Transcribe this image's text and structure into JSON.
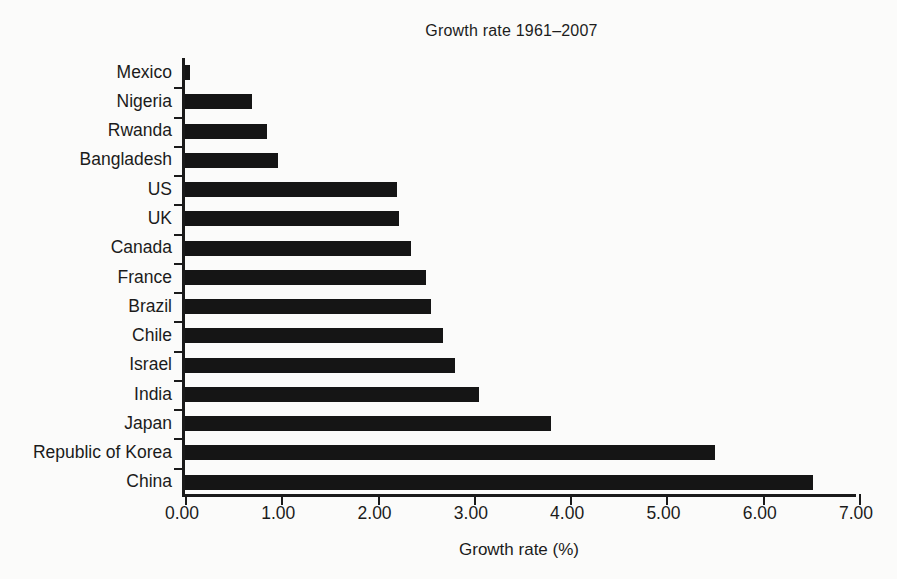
{
  "chart_data": {
    "type": "bar",
    "orientation": "horizontal",
    "title": "Growth rate 1961–2007",
    "xlabel": "Growth rate (%)",
    "ylabel": "",
    "xlim": [
      0.0,
      7.0
    ],
    "xticks": [
      0.0,
      1.0,
      2.0,
      3.0,
      4.0,
      5.0,
      6.0,
      7.0
    ],
    "xtick_labels": [
      "0.00",
      "1.00",
      "2.00",
      "3.00",
      "4.00",
      "5.00",
      "6.00",
      "7.00"
    ],
    "grid": false,
    "legend": null,
    "bar_color": "#151515",
    "axis_color": "#1a1a1a",
    "background": "#fbfbfa",
    "categories": [
      "Mexico",
      "Nigeria",
      "Rwanda",
      "Bangladesh",
      "US",
      "UK",
      "Canada",
      "France",
      "Brazil",
      "Chile",
      "Israel",
      "India",
      "Japan",
      "Republic of Korea",
      "China"
    ],
    "values": [
      0.05,
      0.7,
      0.85,
      0.97,
      2.2,
      2.22,
      2.35,
      2.5,
      2.55,
      2.68,
      2.8,
      3.05,
      3.8,
      5.5,
      6.52
    ]
  }
}
